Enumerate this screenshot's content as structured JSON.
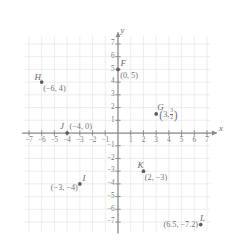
{
  "figure": {
    "type": "coordinate-plane",
    "axes": {
      "x_label": "x",
      "y_label": "y",
      "x_min": -7,
      "x_max": 7,
      "y_min": -7,
      "y_max": 7,
      "x_ticks": [
        -7,
        -6,
        -5,
        -4,
        -3,
        -2,
        -1,
        1,
        2,
        3,
        4,
        5,
        6,
        7
      ],
      "y_ticks": [
        7,
        6,
        5,
        4,
        3,
        2,
        1,
        -1,
        -2,
        -3,
        -4,
        -5,
        -6,
        -7
      ],
      "x_tick_labels": [
        "-7",
        "-6",
        "-5",
        "-4",
        "-3",
        "-2",
        "-1",
        "1",
        "2",
        "3",
        "4",
        "5",
        "6",
        "7"
      ],
      "y_tick_labels": [
        "7",
        "6",
        "5",
        "4",
        "3",
        "2",
        "1",
        "-1",
        "-2",
        "-3",
        "-4",
        "-5",
        "-6",
        "-7"
      ],
      "grid": true,
      "arrowheads": true
    },
    "colors": {
      "axis": "#8a8a90",
      "grid": "#ebebee",
      "point": "#5a5a60",
      "text": "#73737a",
      "background": "#ffffff"
    },
    "points": [
      {
        "name": "F",
        "x": 0,
        "y": 5,
        "coord_text": "(0, 5)"
      },
      {
        "name": "G",
        "x": 3,
        "y": 1.5,
        "coord_text": "(3, 3/2)",
        "numerator": "3",
        "denominator": "2",
        "x_text": "3,"
      },
      {
        "name": "H",
        "x": -6,
        "y": 4,
        "coord_text": "(−6, 4)"
      },
      {
        "name": "I",
        "x": -3,
        "y": -4,
        "coord_text": "(−3, −4)"
      },
      {
        "name": "J",
        "x": -4,
        "y": 0,
        "coord_text": "(−4, 0)"
      },
      {
        "name": "K",
        "x": 2,
        "y": -3,
        "coord_text": "(2, −3)"
      },
      {
        "name": "L",
        "x": 6.5,
        "y": -7.2,
        "coord_text": "(6.5, −7.2)"
      }
    ]
  }
}
